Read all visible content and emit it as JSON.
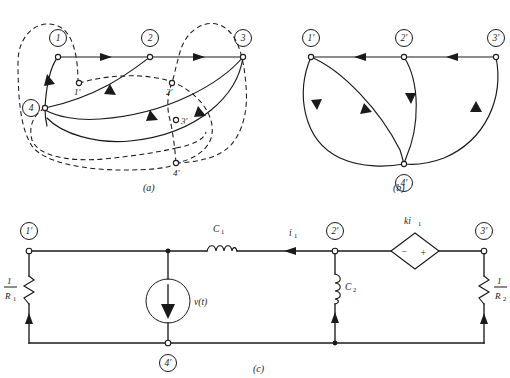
{
  "figure": {
    "panels": [
      {
        "id": "a",
        "caption": "(a)",
        "description": "oriented linear graph with primed and unprimed nodes",
        "nodes": [
          {
            "label": "1",
            "x": 58,
            "y": 38,
            "kind": "circled"
          },
          {
            "label": "2",
            "x": 150,
            "y": 38,
            "kind": "circled"
          },
          {
            "label": "3",
            "x": 243,
            "y": 38,
            "kind": "circled"
          },
          {
            "label": "4",
            "x": 45,
            "y": 108,
            "kind": "circled"
          },
          {
            "label": "1'",
            "x": 79,
            "y": 83,
            "kind": "terminal"
          },
          {
            "label": "2'",
            "x": 172,
            "y": 83,
            "kind": "terminal"
          },
          {
            "label": "3'",
            "x": 176,
            "y": 120,
            "kind": "terminal"
          },
          {
            "label": "4'",
            "x": 176,
            "y": 163,
            "kind": "terminal"
          }
        ]
      },
      {
        "id": "b",
        "caption": "(b)",
        "description": "reduced oriented graph on primed nodes",
        "nodes": [
          {
            "label": "1'",
            "x": 311,
            "y": 38,
            "kind": "circled"
          },
          {
            "label": "2'",
            "x": 404,
            "y": 38,
            "kind": "circled"
          },
          {
            "label": "3'",
            "x": 496,
            "y": 38,
            "kind": "circled"
          },
          {
            "label": "4'",
            "x": 404,
            "y": 170,
            "kind": "circled"
          }
        ]
      },
      {
        "id": "c",
        "caption": "(c)",
        "description": "electrical network realization",
        "nodes": [
          {
            "label": "1'",
            "x": 29,
            "y": 231,
            "kind": "circled"
          },
          {
            "label": "2'",
            "x": 335,
            "y": 231,
            "kind": "circled"
          },
          {
            "label": "3'",
            "x": 484,
            "y": 231,
            "kind": "circled"
          },
          {
            "label": "4'",
            "x": 168,
            "y": 343,
            "kind": "circled"
          }
        ],
        "components": [
          {
            "name": "resistor-left",
            "label_numerator": "1",
            "label_denominator": "R",
            "label_subscript": "1"
          },
          {
            "name": "resistor-right",
            "label_numerator": "1",
            "label_denominator": "R",
            "label_subscript": "2"
          },
          {
            "name": "capacitor-c1",
            "label": "C",
            "subscript": "1"
          },
          {
            "name": "capacitor-c2",
            "label": "C",
            "subscript": "2"
          },
          {
            "name": "current-source",
            "label": "v(t)"
          },
          {
            "name": "dependent-source",
            "label": "ki",
            "subscript": "1",
            "minus": "−",
            "plus": "+"
          },
          {
            "name": "branch-current",
            "label": "i",
            "subscript": "1"
          }
        ]
      }
    ]
  }
}
